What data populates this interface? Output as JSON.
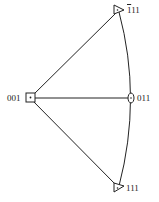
{
  "diagram": {
    "type": "stereographic-triangle",
    "nodes": [
      {
        "id": "n001",
        "label": "001",
        "symbol": "square",
        "x": 30,
        "y": 98
      },
      {
        "id": "n011",
        "label": "011",
        "symbol": "ellipse",
        "x": 131,
        "y": 98
      },
      {
        "id": "nb111",
        "label_bar": "1",
        "label_rest": "11",
        "symbol": "triangle",
        "x": 118,
        "y": 10
      },
      {
        "id": "n111",
        "label": "111",
        "symbol": "triangle",
        "x": 118,
        "y": 188
      }
    ],
    "edges": [
      {
        "from": "n001",
        "to": "nb111",
        "kind": "line"
      },
      {
        "from": "n001",
        "to": "n011",
        "kind": "line"
      },
      {
        "from": "n001",
        "to": "n111",
        "kind": "line"
      },
      {
        "from": "nb111",
        "to": "n011",
        "kind": "arc"
      },
      {
        "from": "n011",
        "to": "n111",
        "kind": "arc"
      }
    ],
    "stroke_color": "#222222"
  }
}
